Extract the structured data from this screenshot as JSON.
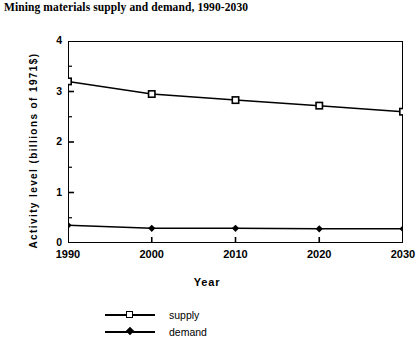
{
  "chart_data": {
    "type": "line",
    "title": "Mining materials supply and demand, 1990-2030",
    "xlabel": "Year",
    "ylabel": "Activity level (billions of 1971$)",
    "categories": [
      "1990",
      "2000",
      "2010",
      "2020",
      "2030"
    ],
    "x": [
      1990,
      2000,
      2010,
      2020,
      2030
    ],
    "series": [
      {
        "name": "supply",
        "marker": "open-square",
        "values": [
          3.2,
          2.95,
          2.83,
          2.72,
          2.6
        ]
      },
      {
        "name": "demand",
        "marker": "filled-diamond",
        "values": [
          0.35,
          0.29,
          0.29,
          0.28,
          0.28
        ]
      }
    ],
    "xlim": [
      1990,
      2030
    ],
    "ylim": [
      0,
      4
    ],
    "ytick_labels": [
      "0",
      "1",
      "2",
      "3",
      "4"
    ],
    "ytick_values": [
      0,
      1,
      2,
      3,
      4
    ],
    "yminor_step": 0.5,
    "grid": false,
    "legend_position": "bottom-left",
    "line_color": "#000000",
    "background_color": "#ffffff"
  }
}
